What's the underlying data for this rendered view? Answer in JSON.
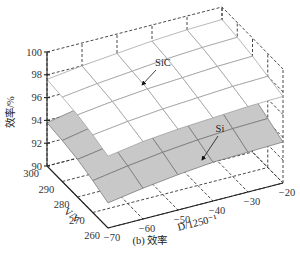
{
  "caption": "(b) 效率",
  "chart_data": {
    "type": "surface3d",
    "title": "",
    "caption": "(b) 效率",
    "xlabel": "D/1250⁻¹",
    "ylabel": "V/V",
    "zlabel": "效率/%",
    "x_ticks": [
      -70,
      -60,
      -50,
      -40,
      -30,
      -20
    ],
    "y_ticks": [
      260,
      270,
      280,
      290,
      300
    ],
    "z_ticks": [
      90,
      92,
      94,
      96,
      98,
      100
    ],
    "xlim": [
      -70,
      -20
    ],
    "ylim": [
      260,
      300
    ],
    "zlim": [
      90,
      100
    ],
    "grid": true,
    "x": [
      -70,
      -60,
      -50,
      -40,
      -30,
      -20
    ],
    "y": [
      300,
      290,
      280,
      270,
      260
    ],
    "series": [
      {
        "name": "SiC",
        "color": "#ffffff",
        "edge_color": "#9a9a9a",
        "z": [
          [
            97.6,
            98.0,
            98.3,
            98.6,
            98.8,
            98.9
          ],
          [
            97.4,
            97.8,
            98.1,
            98.4,
            98.6,
            98.7
          ],
          [
            97.2,
            97.6,
            97.9,
            98.1,
            98.3,
            98.4
          ],
          [
            96.8,
            97.2,
            97.5,
            97.7,
            97.9,
            98.0
          ],
          [
            96.3,
            96.8,
            97.1,
            97.3,
            97.5,
            97.6
          ]
        ]
      },
      {
        "name": "Si",
        "color": "#c8c8c8",
        "edge_color": "#707070",
        "z": [
          [
            93.8,
            94.4,
            94.9,
            95.3,
            95.6,
            95.7
          ],
          [
            93.6,
            94.2,
            94.6,
            95.0,
            95.3,
            95.4
          ],
          [
            93.3,
            93.8,
            94.2,
            94.6,
            94.9,
            95.0
          ],
          [
            92.8,
            93.3,
            93.7,
            94.0,
            94.2,
            94.3
          ],
          [
            92.2,
            92.7,
            93.1,
            93.4,
            93.5,
            93.6
          ]
        ]
      }
    ],
    "annotations": [
      {
        "text": "SiC",
        "target": "upper surface"
      },
      {
        "text": "Si",
        "target": "lower surface"
      }
    ]
  }
}
